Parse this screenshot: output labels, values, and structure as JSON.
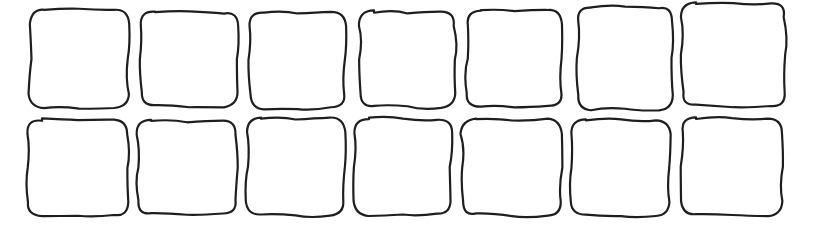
{
  "drawing": {
    "description": "Hand-drawn grid of empty rounded squares",
    "rows": 2,
    "columns": 7,
    "stroke_color": "#1e1e1e",
    "background": "#ffffff",
    "boxes": [
      {
        "row": 0,
        "col": 0,
        "x": 30,
        "y": 10,
        "w": 98,
        "h": 98
      },
      {
        "row": 0,
        "col": 1,
        "x": 141,
        "y": 12,
        "w": 97,
        "h": 94
      },
      {
        "row": 0,
        "col": 2,
        "x": 250,
        "y": 12,
        "w": 95,
        "h": 96
      },
      {
        "row": 0,
        "col": 3,
        "x": 360,
        "y": 12,
        "w": 95,
        "h": 95
      },
      {
        "row": 0,
        "col": 4,
        "x": 467,
        "y": 10,
        "w": 95,
        "h": 97
      },
      {
        "row": 0,
        "col": 5,
        "x": 577,
        "y": 7,
        "w": 96,
        "h": 102
      },
      {
        "row": 0,
        "col": 6,
        "x": 682,
        "y": 3,
        "w": 103,
        "h": 103
      },
      {
        "row": 1,
        "col": 0,
        "x": 28,
        "y": 120,
        "w": 100,
        "h": 96
      },
      {
        "row": 1,
        "col": 1,
        "x": 137,
        "y": 121,
        "w": 100,
        "h": 93
      },
      {
        "row": 1,
        "col": 2,
        "x": 247,
        "y": 118,
        "w": 97,
        "h": 97
      },
      {
        "row": 1,
        "col": 3,
        "x": 355,
        "y": 119,
        "w": 96,
        "h": 96
      },
      {
        "row": 1,
        "col": 4,
        "x": 462,
        "y": 120,
        "w": 100,
        "h": 95
      },
      {
        "row": 1,
        "col": 5,
        "x": 572,
        "y": 120,
        "w": 98,
        "h": 96
      },
      {
        "row": 1,
        "col": 6,
        "x": 682,
        "y": 118,
        "w": 100,
        "h": 97
      }
    ]
  }
}
